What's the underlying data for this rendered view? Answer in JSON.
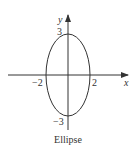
{
  "figure": {
    "caption": "Ellipse",
    "axes": {
      "x_label": "x",
      "y_label": "y"
    },
    "ticks": {
      "x_neg": "−2",
      "x_pos": "2",
      "y_pos": "3",
      "y_neg": "−3"
    },
    "ellipse": {
      "semi_major_y": 3,
      "semi_minor_x": 2,
      "equation_implied": "x^2/4 + y^2/9 = 1"
    },
    "colors": {
      "stroke": "#333333",
      "background": "#ffffff"
    }
  }
}
